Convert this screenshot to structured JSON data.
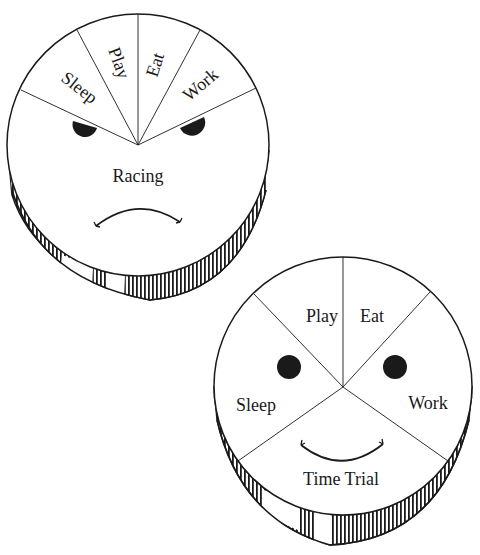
{
  "diagram": {
    "colors": {
      "ink": "#1a1a1a",
      "paper": "#ffffff"
    },
    "racing": {
      "title": "Racing",
      "expression": "frown",
      "segments": [
        "Sleep",
        "Play",
        "Eat",
        "Work"
      ],
      "center_label": "Racing"
    },
    "time_trial": {
      "title": "Time Trial",
      "expression": "smile",
      "segments": [
        "Play",
        "Eat",
        "Work",
        "Time Trial",
        "Sleep"
      ],
      "center_label": "Time Trial"
    }
  }
}
